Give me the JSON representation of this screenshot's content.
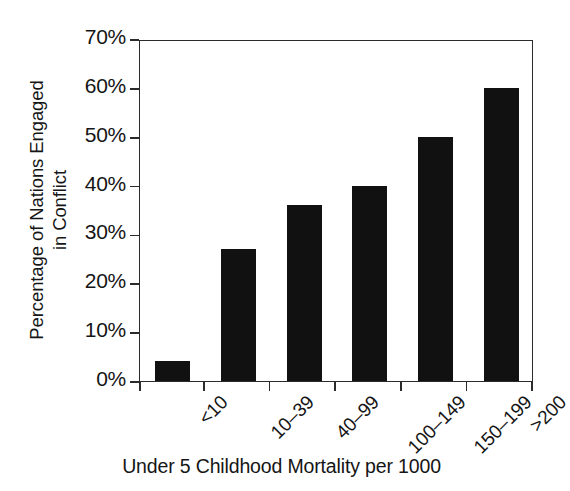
{
  "chart_data": {
    "type": "bar",
    "title": "",
    "subtitle": "",
    "xlabel": "Under 5 Childhood Mortality per 1000",
    "ylabel": "Percentage of Nations Engaged in Conflict",
    "ylabel_line1": "Percentage of Nations Engaged",
    "ylabel_line2": "in Conflict",
    "categories": [
      "<10",
      "10–39",
      "40–99",
      "100–149",
      "150–199",
      ">200"
    ],
    "values": [
      4,
      27,
      36,
      40,
      50,
      60
    ],
    "value_labels": [
      "4%",
      "27%",
      "36%",
      "40%",
      "50%",
      "60%"
    ],
    "ylim": [
      0,
      70
    ],
    "ytick_values": [
      0,
      10,
      20,
      30,
      40,
      50,
      60,
      70
    ],
    "ytick_labels": [
      "0%",
      "10%",
      "20%",
      "30%",
      "40%",
      "50%",
      "60%",
      "70%"
    ],
    "grid": false,
    "legend": null,
    "legend_position": "none",
    "bar_color": "#111111",
    "axis_color": "#2b2b2b",
    "background_color": "#ffffff",
    "orientation": "vertical",
    "annotations": []
  }
}
